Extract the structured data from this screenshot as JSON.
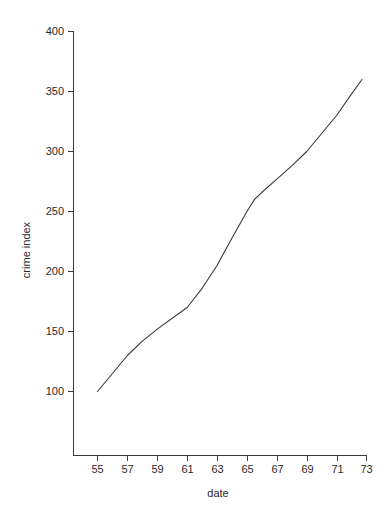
{
  "chart_data": {
    "type": "line",
    "title": "",
    "subtitle": "",
    "xlabel": "date",
    "ylabel": "crime index",
    "xlim": [
      54,
      73.6
    ],
    "ylim": [
      70,
      400
    ],
    "grid": false,
    "legend": null,
    "legend_position": "none",
    "xticks": [
      55,
      57,
      59,
      61,
      63,
      65,
      67,
      69,
      71,
      73
    ],
    "xticklabels": [
      "55",
      "57",
      "59",
      "61",
      "63",
      "65",
      "67",
      "69",
      "71",
      "73"
    ],
    "yticks": [
      100,
      150,
      200,
      250,
      300,
      350,
      400
    ],
    "yticklabels": [
      "100",
      "150",
      "200",
      "250",
      "300",
      "350",
      "400"
    ],
    "series": [
      {
        "name": "crime index",
        "color": "#3d3d43",
        "x": [
          55,
          56,
          57,
          58,
          59,
          60,
          61,
          62,
          63,
          64,
          65,
          65.5,
          66,
          67,
          68,
          69,
          70,
          71,
          72,
          72.7
        ],
        "values": [
          100,
          115,
          130,
          142,
          152,
          161,
          170,
          186,
          205,
          228,
          250,
          260,
          266,
          277,
          288,
          300,
          315,
          330,
          348,
          360
        ]
      }
    ],
    "annotations": []
  },
  "axes": {
    "y_axis_label": "crime index",
    "x_axis_label": "date"
  }
}
